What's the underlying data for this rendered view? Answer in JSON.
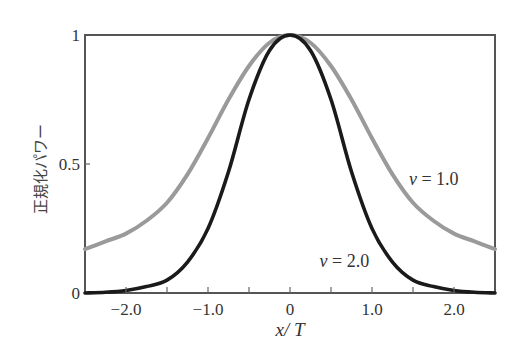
{
  "chart_data": {
    "type": "line",
    "title": "",
    "xlabel": "x / T",
    "xlabel_parts": {
      "var": "x",
      "sep": "/",
      "unit": "T"
    },
    "ylabel": "正規化パワー",
    "xlim": [
      -2.5,
      2.5
    ],
    "ylim": [
      0,
      1
    ],
    "grid": false,
    "legend": "inline annotations",
    "x_ticks": [
      -2.0,
      -1.5,
      -1.0,
      -0.5,
      0,
      0.5,
      1.0,
      1.5,
      2.0
    ],
    "x_tick_labels": [
      {
        "value": -2.0,
        "label": "−2.0"
      },
      {
        "value": -1.0,
        "label": "−1.0"
      },
      {
        "value": 0,
        "label": "0"
      },
      {
        "value": 1.0,
        "label": "1.0"
      },
      {
        "value": 2.0,
        "label": "2.0"
      }
    ],
    "y_ticks": [
      0,
      0.5,
      1
    ],
    "y_tick_labels": [
      {
        "value": 0,
        "label": "0"
      },
      {
        "value": 0.5,
        "label": "0.5"
      },
      {
        "value": 1,
        "label": "1"
      }
    ],
    "x": [
      -2.5,
      -2.25,
      -2.0,
      -1.75,
      -1.5,
      -1.25,
      -1.0,
      -0.75,
      -0.5,
      -0.25,
      0,
      0.25,
      0.5,
      0.75,
      1.0,
      1.25,
      1.5,
      1.75,
      2.0,
      2.25,
      2.5
    ],
    "series": [
      {
        "name": "v = 1.0",
        "color": "#9a9a9a",
        "values": [
          0.17,
          0.2,
          0.23,
          0.28,
          0.35,
          0.46,
          0.6,
          0.75,
          0.88,
          0.97,
          1.0,
          0.97,
          0.88,
          0.75,
          0.6,
          0.46,
          0.35,
          0.28,
          0.23,
          0.2,
          0.17
        ]
      },
      {
        "name": "v = 2.0",
        "color": "#1a1a1a",
        "values": [
          0.0,
          0.003,
          0.01,
          0.025,
          0.05,
          0.12,
          0.25,
          0.47,
          0.75,
          0.94,
          1.0,
          0.94,
          0.75,
          0.47,
          0.25,
          0.12,
          0.05,
          0.025,
          0.01,
          0.003,
          0.0
        ]
      }
    ],
    "annotations": [
      {
        "var": "v",
        "text": " = 1.0",
        "series": "v = 1.0",
        "x": 1.45,
        "y": 0.42
      },
      {
        "var": "v",
        "text": " = 2.0",
        "series": "v = 2.0",
        "x": 0.36,
        "y": 0.1
      }
    ]
  }
}
